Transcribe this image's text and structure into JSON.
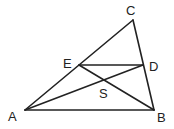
{
  "diagram": {
    "type": "geometry-triangle",
    "points": {
      "A": {
        "label": "A",
        "x": 25,
        "y": 110
      },
      "B": {
        "label": "B",
        "x": 154,
        "y": 110
      },
      "C": {
        "label": "C",
        "x": 133,
        "y": 20
      },
      "E": {
        "label": "E",
        "x": 79,
        "y": 65
      },
      "D": {
        "label": "D",
        "x": 143,
        "y": 65
      },
      "S": {
        "label": "S",
        "x": 104,
        "y": 82
      }
    },
    "segments": [
      [
        "A",
        "C"
      ],
      [
        "C",
        "B"
      ],
      [
        "A",
        "B"
      ],
      [
        "E",
        "D"
      ],
      [
        "A",
        "D"
      ],
      [
        "E",
        "B"
      ]
    ],
    "stroke_color": "#222222"
  }
}
